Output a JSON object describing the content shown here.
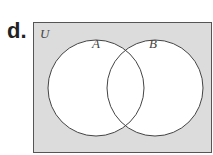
{
  "problem_label": "d.",
  "venn": {
    "universe_label": "U",
    "sets": [
      {
        "label": "A"
      },
      {
        "label": "B"
      }
    ],
    "shaded_region": "complement of A union B",
    "colors": {
      "shade": "#dcdcdc",
      "circles": "#ffffff",
      "stroke": "#444444"
    }
  }
}
